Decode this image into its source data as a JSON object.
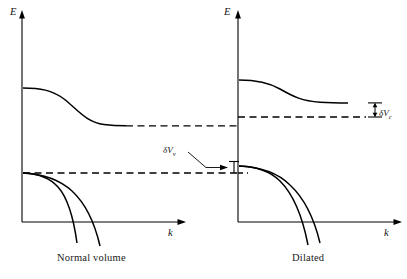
{
  "figure": {
    "type": "band-structure-diagram",
    "panels": [
      {
        "id": "normal",
        "caption": "Normal volume",
        "y_axis_label": "E",
        "x_axis_label": "k",
        "conduction_band_start_energy": 88,
        "conduction_band_end_energy": 125,
        "valence_band_top_energy": 173,
        "band_gap_reference": "dashed lines mark conduction minimum and valence maximum"
      },
      {
        "id": "dilated",
        "caption": "Dilated",
        "y_axis_label": "E",
        "x_axis_label": "k",
        "conduction_band_start_energy": 80,
        "conduction_band_end_energy": 102,
        "valence_band_top_energy": 166,
        "band_gap_reference": "dashed lines carried over from normal volume panel"
      }
    ],
    "annotations": [
      {
        "id": "delta-v-valence",
        "symbol": "δV",
        "subscript": "v",
        "meaning": "shift of valence band edge on dilation",
        "panel": "normal",
        "leader_line": true
      },
      {
        "id": "delta-v-conduction",
        "symbol": "δV",
        "subscript": "c",
        "meaning": "shift of conduction band edge on dilation",
        "panel": "dilated",
        "bracket": true
      }
    ],
    "colors": {
      "curve": "#000000",
      "axis": "#000000",
      "dashed": "#000000",
      "background": "#ffffff"
    }
  }
}
